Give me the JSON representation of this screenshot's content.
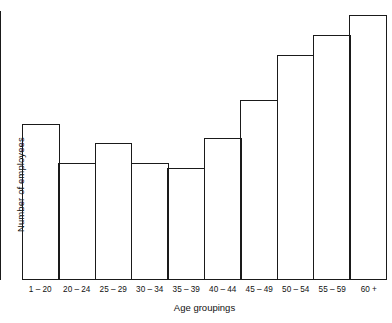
{
  "chart_data": {
    "type": "bar",
    "title": "",
    "xlabel": "Age groupings",
    "ylabel": "Number of employees",
    "categories": [
      "1 – 20",
      "20 – 24",
      "25 – 29",
      "30 – 34",
      "35 – 39",
      "40 – 44",
      "45 – 49",
      "50 – 54",
      "55 – 59",
      "60 +"
    ],
    "values": [
      155,
      116,
      136,
      116,
      111,
      141,
      179,
      224,
      244,
      264
    ],
    "value_units": "relative bar height (pixels; axis unlabelled)",
    "ylim": [
      0,
      268
    ],
    "xlim_note": "10 equal-width contiguous bins, no gaps",
    "grid": false,
    "legend": null,
    "y_tick_labels": [],
    "x_tick_labels": [
      "1 – 20",
      "20 – 24",
      "25 – 29",
      "30 – 34",
      "35 – 39",
      "40 – 44",
      "45 – 49",
      "50 – 54",
      "55 – 59",
      "60 +"
    ],
    "style": {
      "bar_fill": "#ffffff",
      "bar_outline": "#1a1a1a",
      "axis_color": "#1a1a1a",
      "background": "#ffffff",
      "text_color": "#111111"
    }
  },
  "axes": {
    "y_title": "Number of employees",
    "x_title": "Age groupings"
  }
}
